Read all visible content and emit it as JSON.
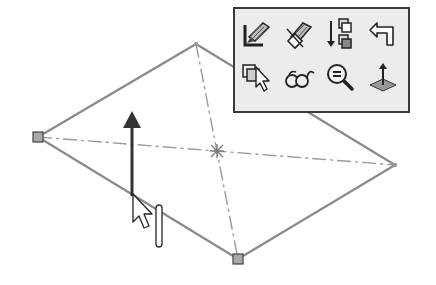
{
  "viewport": {
    "background": "#ffffff",
    "sketch": {
      "shape": "quadrilateral",
      "line_color": "#8a8a8a",
      "centerline_color": "#9a9a9a",
      "vertices": {
        "left": {
          "x": 38,
          "y": 137,
          "marker": "square"
        },
        "top": {
          "x": 196,
          "y": 44,
          "marker": "point"
        },
        "right": {
          "x": 395,
          "y": 165,
          "marker": "point"
        },
        "bottom": {
          "x": 238,
          "y": 259,
          "marker": "square"
        }
      },
      "center": {
        "x": 217,
        "y": 151
      }
    },
    "direction_arrow": {
      "tail": {
        "x": 132,
        "y": 195
      },
      "tip": {
        "x": 132,
        "y": 112
      },
      "color": "#333333"
    },
    "cursor": {
      "x": 133,
      "y": 194,
      "type": "extrude-pointer"
    }
  },
  "context_toolbar": {
    "rows": [
      [
        {
          "icon": "edit-sketch-icon",
          "tooltip": "Edit Sketch"
        },
        {
          "icon": "exit-sketch-icon",
          "tooltip": "Exit Sketch"
        },
        {
          "icon": "reorder-icon",
          "tooltip": "Move/Reorder"
        },
        {
          "icon": "undo-arrow-icon",
          "tooltip": "Undo"
        }
      ],
      [
        {
          "icon": "select-other-icon",
          "tooltip": "Select Other"
        },
        {
          "icon": "view-glasses-icon",
          "tooltip": "Show/Hide"
        },
        {
          "icon": "zoom-to-selection-icon",
          "tooltip": "Zoom to Selection"
        },
        {
          "icon": "normal-to-icon",
          "tooltip": "Normal To"
        }
      ]
    ],
    "border_color": "#3a3a3a",
    "background": "#ececec"
  }
}
